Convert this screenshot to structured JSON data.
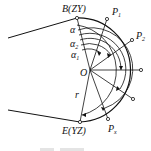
{
  "figure": {
    "labels": {
      "B": "B(ZY)",
      "E": "E(YZ)",
      "P1": "P",
      "P1_sub": "1",
      "P2": "P",
      "P2_sub": "2",
      "Px": "P",
      "Px_sub": "x",
      "O": "O",
      "r": "r",
      "alpha": "α",
      "alpha2": "α",
      "alpha2_sub": "2",
      "alpha1": "α",
      "alpha1_sub": "1"
    },
    "caption": ""
  }
}
